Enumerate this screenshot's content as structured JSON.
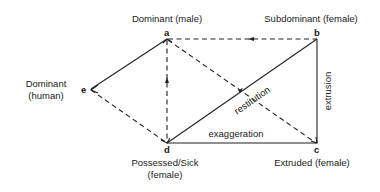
{
  "diagram": {
    "nodes": {
      "a": {
        "letter": "a",
        "label": "Dominant (male)"
      },
      "b": {
        "letter": "b",
        "label": "Subdominant (female)"
      },
      "c": {
        "letter": "c",
        "label": "Extruded (female)"
      },
      "d": {
        "letter": "d",
        "label_line1": "Possessed/Sick",
        "label_line2": "(female)"
      },
      "e": {
        "letter": "e",
        "label_line1": "Dominant",
        "label_line2": "(human)"
      }
    },
    "edges": {
      "restitution": "restitution",
      "extrusion": "extrusion",
      "exaggeration": "exaggeration"
    },
    "edge_list": [
      {
        "from": "e",
        "to": "a",
        "style": "solid"
      },
      {
        "from": "e",
        "to": "d",
        "style": "dashed"
      },
      {
        "from": "a",
        "to": "b",
        "style": "dashed",
        "arrow": "toward a"
      },
      {
        "from": "a",
        "to": "d",
        "style": "dashed",
        "arrow": "toward a"
      },
      {
        "from": "a",
        "to": "c",
        "style": "dashed"
      },
      {
        "from": "d",
        "to": "b",
        "style": "solid",
        "label": "restitution"
      },
      {
        "from": "b",
        "to": "c",
        "style": "solid",
        "label": "extrusion"
      },
      {
        "from": "d",
        "to": "c",
        "style": "solid",
        "label": "exaggeration"
      }
    ]
  }
}
